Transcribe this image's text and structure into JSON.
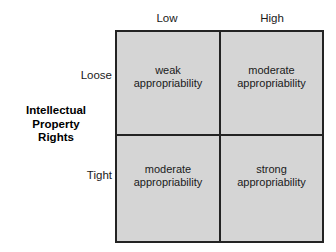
{
  "matrix": {
    "column_axis": {
      "headers": [
        {
          "label": "Low"
        },
        {
          "label": "High"
        }
      ]
    },
    "row_axis": {
      "title_lines": [
        "Intellectual",
        "Property",
        "Rights"
      ],
      "headers": [
        {
          "label": "Loose"
        },
        {
          "label": "Tight"
        }
      ]
    },
    "cells": [
      {
        "row": "Loose",
        "column": "Low",
        "line1": "weak",
        "line2": "appropriability"
      },
      {
        "row": "Loose",
        "column": "High",
        "line1": "moderate",
        "line2": "appropriability"
      },
      {
        "row": "Tight",
        "column": "Low",
        "line1": "moderate",
        "line2": "appropriability"
      },
      {
        "row": "Tight",
        "column": "High",
        "line1": "strong",
        "line2": "appropriability"
      }
    ],
    "colors": {
      "cell_fill": "#d5d5d5",
      "border": "#232323",
      "background": "#ffffff",
      "text": "#1a1a1a"
    }
  }
}
